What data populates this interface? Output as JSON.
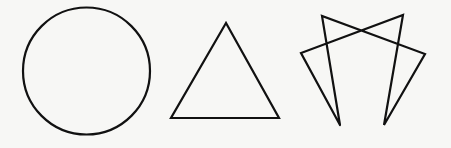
{
  "figure": {
    "width": 451,
    "height": 148,
    "background": "#f7f7f5",
    "stroke_color": "#111111",
    "shapes": [
      {
        "name": "circle",
        "cx": 86.5,
        "cy": 71,
        "r": 63.5
      },
      {
        "name": "triangle",
        "points": "226,23 171,118 279,118"
      },
      {
        "name": "open-star-figure",
        "points": "340,125 322,16 425,54 384,125 403,15 301,53 340,125"
      }
    ]
  }
}
